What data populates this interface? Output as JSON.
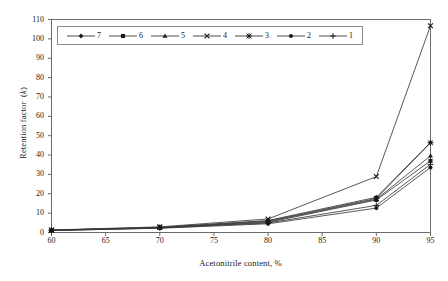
{
  "chart_data": {
    "type": "line",
    "title": "",
    "xlabel": "Acetonitrile content, %",
    "ylabel": "Retention factor (k)",
    "ylabel_plain": "Retention factor",
    "ylabel_italic": "k",
    "x": [
      60,
      70,
      80,
      90,
      95
    ],
    "xlim": [
      60,
      95
    ],
    "ylim": [
      0,
      110
    ],
    "xticks": [
      60,
      65,
      70,
      75,
      80,
      85,
      90,
      95
    ],
    "yticks": [
      0,
      10,
      20,
      30,
      40,
      50,
      60,
      70,
      80,
      90,
      100,
      110
    ],
    "grid": false,
    "legend_position": "top-left-inside",
    "line_color": "#3a3a3a",
    "marker_color": "#1a1a1a",
    "axis_color": "#6b6b6b",
    "series": [
      {
        "name": "7",
        "marker": "diamond",
        "values": [
          1.2,
          2.6,
          6.2,
          18.2,
          46.5
        ]
      },
      {
        "name": "6",
        "marker": "square",
        "values": [
          1.1,
          2.4,
          5.2,
          16.8,
          37.0
        ]
      },
      {
        "name": "5",
        "marker": "triangle",
        "values": [
          1.2,
          2.5,
          5.6,
          17.2,
          39.6
        ]
      },
      {
        "name": "4",
        "marker": "x",
        "values": [
          1.3,
          2.9,
          7.0,
          28.9,
          106.8
        ]
      },
      {
        "name": "3",
        "marker": "star",
        "values": [
          1.2,
          2.7,
          5.9,
          17.6,
          46.3
        ]
      },
      {
        "name": "2",
        "marker": "circle",
        "values": [
          1.0,
          2.2,
          4.5,
          12.6,
          33.6
        ]
      },
      {
        "name": "1",
        "marker": "plus",
        "values": [
          1.0,
          2.3,
          4.9,
          14.0,
          35.2
        ]
      }
    ]
  }
}
